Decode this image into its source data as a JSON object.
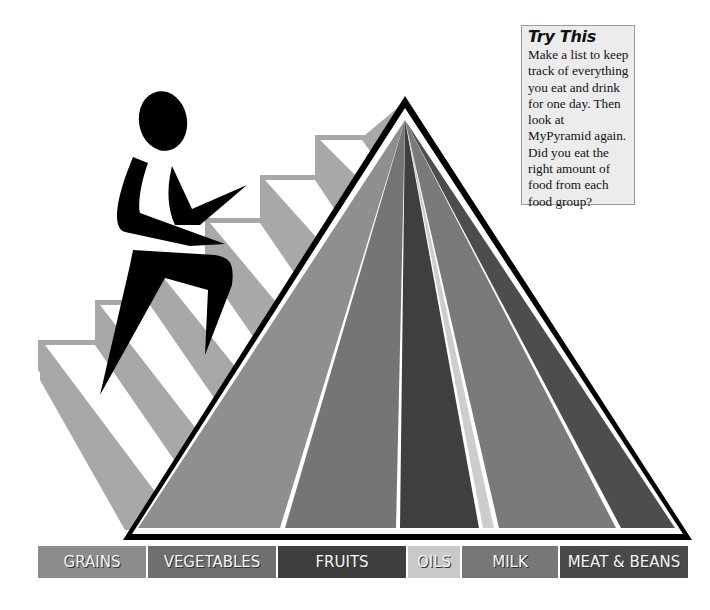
{
  "try_this": {
    "title": "Try This",
    "body": "Make a list to keep track of everything you eat and drink for one day. Then look at MyPyramid again. Did you eat the right amount of food from each food group?"
  },
  "food_groups": [
    {
      "label": "GRAINS",
      "color": "#8c8c8c",
      "width": 108
    },
    {
      "label": "VEGETABLES",
      "color": "#6f6f6f",
      "width": 128
    },
    {
      "label": "FRUITS",
      "color": "#3e3e3e",
      "width": 128
    },
    {
      "label": "OILS",
      "color": "#c9c9c9",
      "width": 52
    },
    {
      "label": "MILK",
      "color": "#777777",
      "width": 96
    },
    {
      "label": "MEAT & BEANS",
      "color": "#4a4a4a",
      "width": 128
    }
  ],
  "pyramid": {
    "stripe_colors": [
      "#8f8f8f",
      "#757575",
      "#3f3f3f",
      "#cdcdcd",
      "#7a7a7a",
      "#4d4d4d"
    ]
  },
  "figure": {
    "color": "#000000"
  },
  "stairs_color": "#a8a8a8"
}
